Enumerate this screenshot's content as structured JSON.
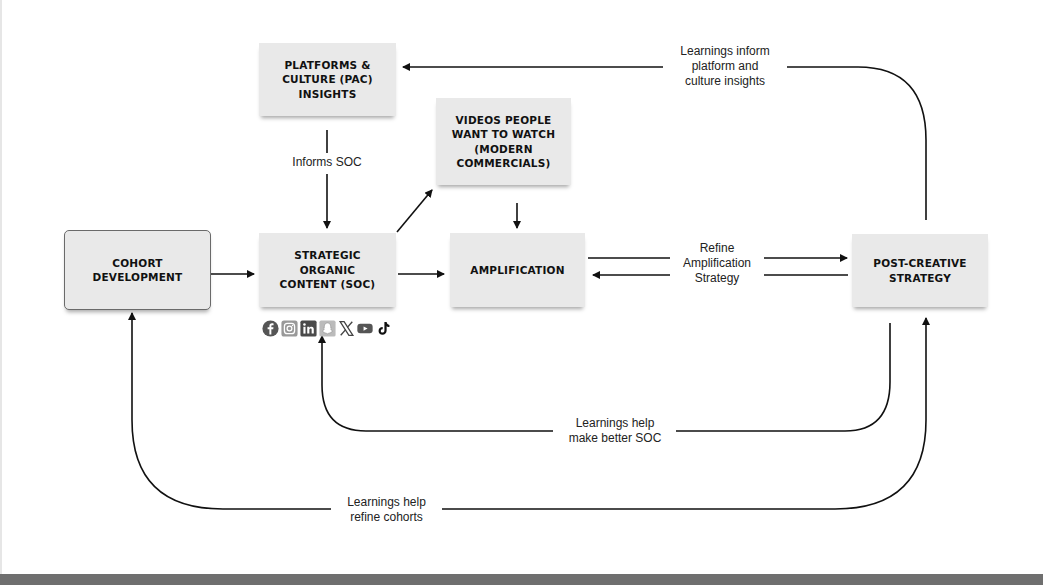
{
  "diagram": {
    "nodes": {
      "pac": {
        "label": "PLATFORMS &\nCULTURE (PAC)\nINSIGHTS"
      },
      "videos": {
        "label": "VIDEOS PEOPLE\nWANT TO WATCH\n(MODERN\nCOMMERCIALS)"
      },
      "cohort": {
        "label": "COHORT\nDEVELOPMENT"
      },
      "soc": {
        "label": "STRATEGIC\nORGANIC\nCONTENT (SOC)"
      },
      "amplification": {
        "label": "AMPLIFICATION"
      },
      "post_creative": {
        "label": "POST-CREATIVE\nSTRATEGY"
      }
    },
    "edge_labels": {
      "informs_soc": "Informs SOC",
      "learnings_inform_pac": "Learnings inform\nplatform and\nculture insights",
      "refine_amplification": "Refine\nAmplification\nStrategy",
      "learnings_better_soc": "Learnings help\nmake better SOC",
      "learnings_refine_cohorts": "Learnings help\nrefine cohorts"
    },
    "social_icons": [
      "facebook-icon",
      "instagram-icon",
      "linkedin-icon",
      "snapchat-icon",
      "x-icon",
      "youtube-icon",
      "tiktok-icon"
    ],
    "colors": {
      "node_fill": "#e9e9e9",
      "line": "#111111",
      "bottom_bar": "#6f6f6f"
    }
  }
}
